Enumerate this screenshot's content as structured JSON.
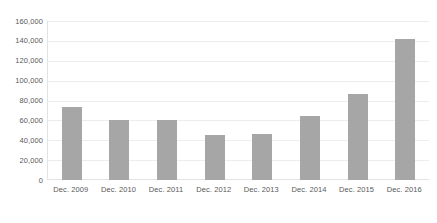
{
  "chart_data": {
    "type": "bar",
    "title": "",
    "subtitle": "",
    "xlabel": "",
    "ylabel": "",
    "categories": [
      "Dec. 2009",
      "Dec. 2010",
      "Dec. 2011",
      "Dec. 2012",
      "Dec. 2013",
      "Dec. 2014",
      "Dec. 2015",
      "Dec. 2016"
    ],
    "values": [
      73000,
      60000,
      60500,
      45000,
      46000,
      64000,
      87000,
      142000
    ],
    "ylim": [
      0,
      160000
    ],
    "ytick_step": 20000,
    "ytick_labels": [
      "0",
      "20,000",
      "40,000",
      "60,000",
      "80,000",
      "100,000",
      "120,000",
      "140,000",
      "160,000"
    ],
    "ytick_values": [
      0,
      20000,
      40000,
      60000,
      80000,
      100000,
      120000,
      140000,
      160000
    ],
    "grid": true,
    "grid_axis": "y",
    "legend": false,
    "legend_position": "none",
    "annotations": [],
    "bar_color": "#a6a6a6",
    "gridline_color": "#ededed",
    "axis_line_color": "#e3e3e3",
    "text_color": "#595959",
    "background_color": "#ffffff"
  }
}
